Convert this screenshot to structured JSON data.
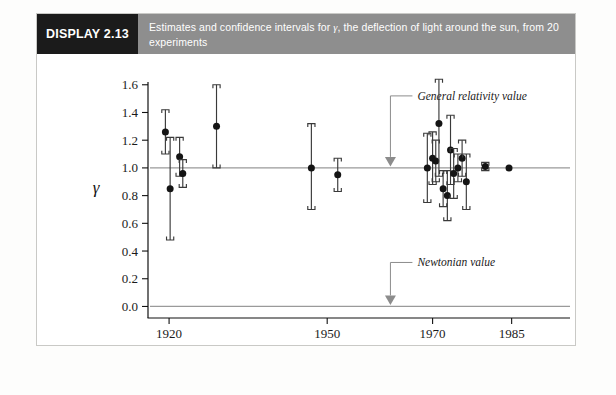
{
  "header": {
    "display_tag": "DISPLAY 2.13",
    "caption_prefix": "Estimates and confidence intervals for ",
    "caption_symbol": "γ",
    "caption_suffix": ", the deflection of light around the sun, from 20 experiments"
  },
  "chart_data": {
    "type": "scatter",
    "title": "Estimates and confidence intervals for γ, the deflection of light around the sun, from 20 experiments",
    "xlabel": "Year of Experiment",
    "ylabel": "γ",
    "xlim": [
      1916,
      1990
    ],
    "ylim": [
      -0.04,
      1.62
    ],
    "grid": false,
    "legend": null,
    "xticks": [
      1920,
      1950,
      1970,
      1985
    ],
    "xtick_labels": [
      "1920",
      "1950",
      "1970",
      "1985"
    ],
    "yticks": [
      0.0,
      0.2,
      0.4,
      0.6,
      0.8,
      1.0,
      1.2,
      1.4,
      1.6
    ],
    "ytick_labels": [
      "0.0",
      "0.2",
      "0.4",
      "0.6",
      "0.8",
      "1.0",
      "1.2",
      "1.4",
      "1.6"
    ],
    "reference_lines": [
      {
        "name": "general-relativity",
        "y": 1.0,
        "label": "General relativity value"
      },
      {
        "name": "newtonian",
        "y": 0.0,
        "label": "Newtonian value"
      }
    ],
    "annotations": [
      {
        "text": "General relativity value",
        "points_to_y": 1.0,
        "points_to_x": 1962
      },
      {
        "text": "Newtonian value",
        "points_to_y": 0.0,
        "points_to_x": 1962
      }
    ],
    "series": [
      {
        "name": "gamma estimates with confidence intervals",
        "x": [
          1919.3,
          1920.2,
          1922.0,
          1922.6,
          1929.0,
          1947.0,
          1952.0,
          1969.0,
          1970.0,
          1970.6,
          1971.2,
          1972.0,
          1972.8,
          1973.4,
          1974.0,
          1974.8,
          1975.6,
          1976.4,
          1980.0,
          1984.5
        ],
        "estimate": [
          1.26,
          0.85,
          1.08,
          0.96,
          1.3,
          1.0,
          0.95,
          1.0,
          1.07,
          1.05,
          1.32,
          0.85,
          0.8,
          1.13,
          0.96,
          1.0,
          1.07,
          0.9,
          1.01,
          1.0
        ],
        "lower": [
          1.1,
          0.48,
          0.94,
          0.86,
          1.0,
          0.7,
          0.83,
          0.75,
          0.88,
          0.9,
          0.94,
          0.72,
          0.62,
          0.88,
          0.78,
          0.9,
          0.94,
          0.7,
          0.98,
          1.0
        ],
        "upper": [
          1.42,
          1.22,
          1.22,
          1.06,
          1.6,
          1.32,
          1.07,
          1.25,
          1.26,
          1.2,
          1.64,
          0.98,
          0.98,
          1.38,
          1.14,
          1.1,
          1.2,
          1.1,
          1.04,
          1.0
        ]
      }
    ]
  }
}
